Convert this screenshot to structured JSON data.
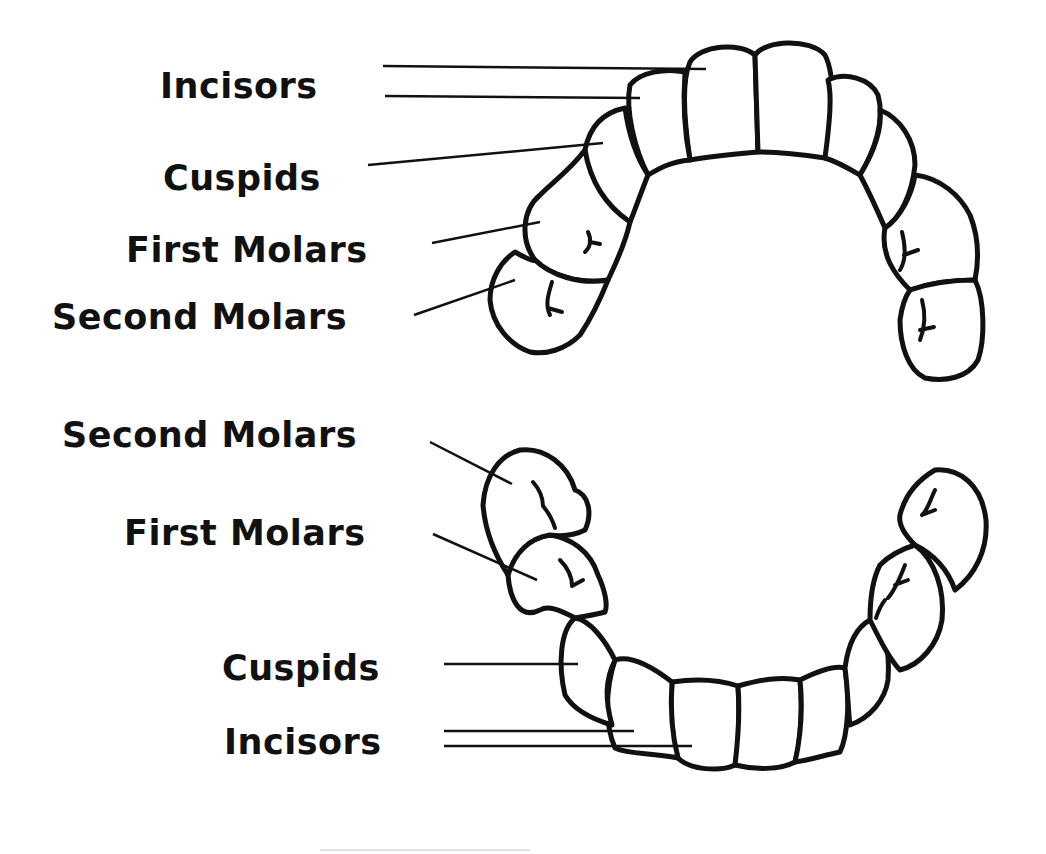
{
  "diagram": {
    "colors": {
      "ink": "#111111",
      "background": "#ffffff"
    },
    "upper_arch": {
      "labels": [
        {
          "id": "upper-incisors",
          "text": "Incisors"
        },
        {
          "id": "upper-cuspids",
          "text": "Cuspids"
        },
        {
          "id": "upper-first-molars",
          "text": "First Molars"
        },
        {
          "id": "upper-second-molars",
          "text": "Second Molars"
        }
      ]
    },
    "lower_arch": {
      "labels": [
        {
          "id": "lower-second-molars",
          "text": "Second Molars"
        },
        {
          "id": "lower-first-molars",
          "text": "First Molars"
        },
        {
          "id": "lower-cuspids",
          "text": "Cuspids"
        },
        {
          "id": "lower-incisors",
          "text": "Incisors"
        }
      ]
    }
  }
}
